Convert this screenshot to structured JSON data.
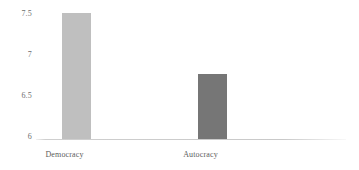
{
  "chart_data": {
    "type": "bar",
    "title": "",
    "subtitle": "",
    "xlabel": "",
    "ylabel": "",
    "categories": [
      "Democracy",
      "Autocracy"
    ],
    "values": [
      7.44,
      6.75
    ],
    "bar_colors": [
      "#bfbfbf",
      "#767676"
    ],
    "ylim": [
      6,
      7.5
    ],
    "yticks": [
      6,
      6.5,
      7,
      7.5
    ],
    "ytick_labels": [
      "6",
      "6.5",
      "7",
      "7.5"
    ],
    "grid": false,
    "legend": null,
    "annotations": []
  },
  "axis": {
    "baseline_color": "#c9c9c9",
    "tick_label_color": "#6e6e6e",
    "category_label_color": "#5d5d5d"
  }
}
